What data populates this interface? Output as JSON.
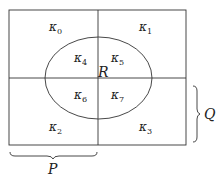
{
  "diagram": {
    "type": "karnaugh-venn",
    "rectangle": {
      "x": 9,
      "y": 10,
      "w": 177,
      "h": 135
    },
    "mid_x": 98,
    "mid_y": 78,
    "ellipse": {
      "cx": 98.5,
      "cy": 78,
      "rx": 53.5,
      "ry": 41
    },
    "cells": [
      {
        "id": "k0",
        "symbol": "κ",
        "sub": "0",
        "x": 49,
        "y": 31
      },
      {
        "id": "k1",
        "symbol": "κ",
        "sub": "1",
        "x": 139,
        "y": 31
      },
      {
        "id": "k4",
        "symbol": "κ",
        "sub": "4",
        "x": 74,
        "y": 62
      },
      {
        "id": "k5",
        "symbol": "κ",
        "sub": "5",
        "x": 111,
        "y": 62
      },
      {
        "id": "k6",
        "symbol": "κ",
        "sub": "6",
        "x": 74,
        "y": 99
      },
      {
        "id": "k7",
        "symbol": "κ",
        "sub": "7",
        "x": 111,
        "y": 99
      },
      {
        "id": "k2",
        "symbol": "κ",
        "sub": "2",
        "x": 49,
        "y": 131
      },
      {
        "id": "k3",
        "symbol": "κ",
        "sub": "3",
        "x": 139,
        "y": 131
      }
    ],
    "labels": {
      "R": "R",
      "P": "P",
      "Q": "Q"
    },
    "colors": {
      "stroke": "#333333",
      "text": "#222222",
      "background": "#ffffff"
    }
  }
}
